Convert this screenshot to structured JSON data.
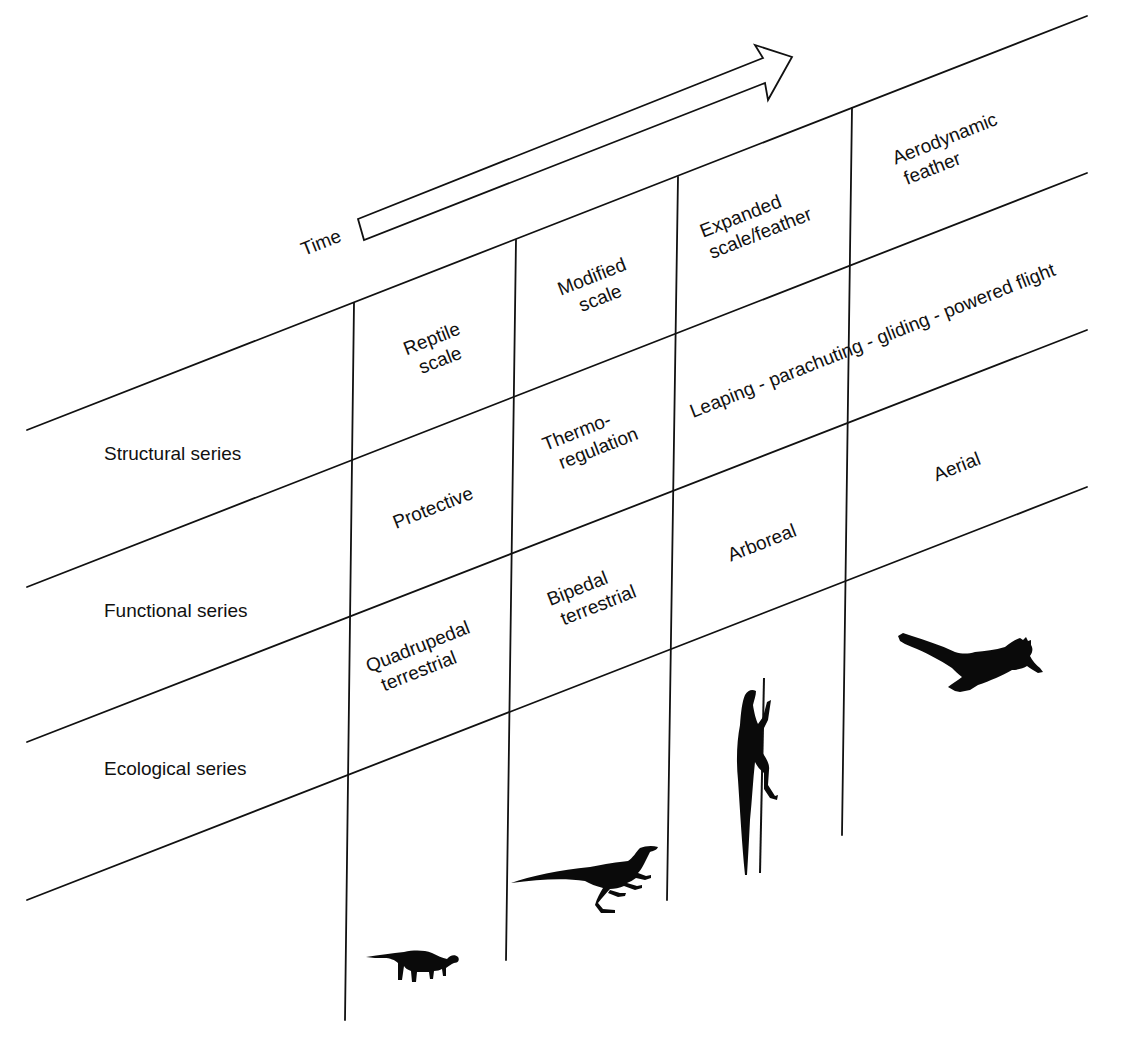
{
  "figure": {
    "time_arrow": {
      "label": "Time"
    },
    "row_labels": [
      {
        "id": "structural",
        "label": "Structural series"
      },
      {
        "id": "functional",
        "label": "Functional series"
      },
      {
        "id": "ecological",
        "label": "Ecological series"
      }
    ],
    "structural_cells": [
      {
        "lines": [
          "Reptile",
          "scale"
        ]
      },
      {
        "lines": [
          "Modified",
          "scale"
        ]
      },
      {
        "lines": [
          "Expanded",
          "scale/feather"
        ]
      },
      {
        "lines": [
          "Aerodynamic",
          "feather"
        ]
      }
    ],
    "functional_cells": [
      {
        "lines": [
          "Protective"
        ]
      },
      {
        "lines": [
          "Thermo-",
          "regulation"
        ]
      },
      {
        "lines": [
          "Leaping - parachuting - gliding - powered flight"
        ]
      }
    ],
    "ecological_cells": [
      {
        "lines": [
          "Quadrupedal",
          "terrestrial"
        ]
      },
      {
        "lines": [
          "Bipedal",
          "terrestrial"
        ]
      },
      {
        "lines": [
          "Arboreal"
        ]
      },
      {
        "lines": [
          "Aerial"
        ]
      }
    ],
    "silhouettes": [
      {
        "name": "quadrupedal-dinosaur",
        "stage": "Quadrupedal terrestrial"
      },
      {
        "name": "bipedal-dinosaur",
        "stage": "Bipedal terrestrial"
      },
      {
        "name": "climbing-dinosaur",
        "stage": "Arboreal"
      },
      {
        "name": "flying-dinosaur",
        "stage": "Aerial"
      }
    ],
    "colors": {
      "ink": "#111111",
      "background": "#ffffff"
    }
  }
}
